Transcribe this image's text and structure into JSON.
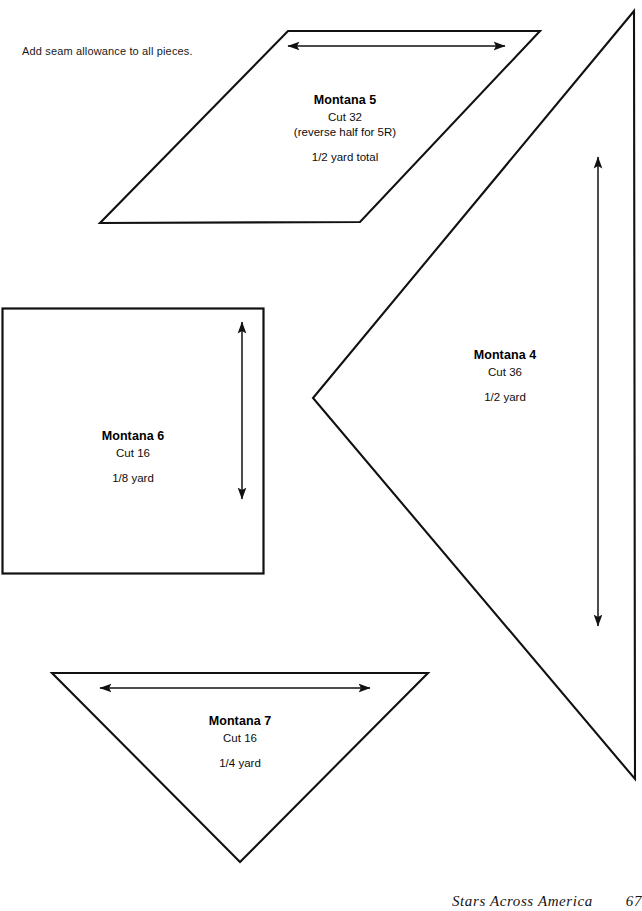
{
  "document": {
    "instruction_note": "Add seam allowance to all pieces.",
    "footer_credit": "Stars Across America",
    "footer_page": "67"
  },
  "pieces": [
    {
      "id": "montana-5",
      "shape": "parallelogram",
      "name": "Montana 5",
      "cut": "Cut 32",
      "note": "(reverse half for 5R)",
      "yardage": "1/2 yard total",
      "grain_arrow": "horizontal"
    },
    {
      "id": "montana-4",
      "shape": "triangle-right-pointing-left-apex",
      "name": "Montana 4",
      "cut": "Cut 36",
      "note": "",
      "yardage": "1/2 yard",
      "grain_arrow": "vertical"
    },
    {
      "id": "montana-6",
      "shape": "square",
      "name": "Montana 6",
      "cut": "Cut 16",
      "note": "",
      "yardage": "1/8 yard",
      "grain_arrow": "vertical"
    },
    {
      "id": "montana-7",
      "shape": "triangle-down-apex",
      "name": "Montana 7",
      "cut": "Cut 16",
      "note": "",
      "yardage": "1/4 yard",
      "grain_arrow": "horizontal"
    }
  ],
  "icons": {
    "grain_arrow_horizontal": "double-headed-horizontal-arrow",
    "grain_arrow_vertical": "double-headed-vertical-arrow"
  },
  "colors": {
    "ink": "#000000",
    "paper": "#ffffff",
    "outline": "#111111"
  }
}
